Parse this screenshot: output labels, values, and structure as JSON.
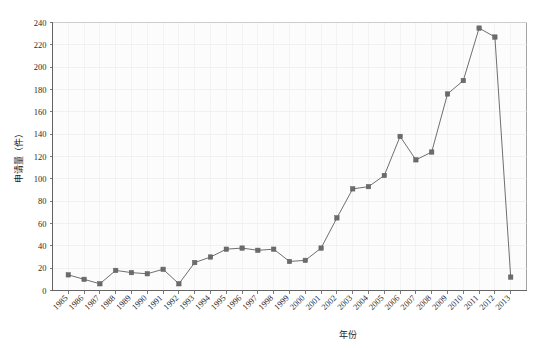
{
  "chart_data": {
    "type": "line",
    "title": "",
    "xlabel": "年份",
    "ylabel": "申请量（件）",
    "ylim": [
      0,
      240
    ],
    "ytick_step": 20,
    "grid": true,
    "legend": "none",
    "marker": "square",
    "series_color": "#6b6b6b",
    "line_color": "#6f6f6f",
    "categories": [
      "1985",
      "1986",
      "1987",
      "1988",
      "1989",
      "1990",
      "1991",
      "1992",
      "1993",
      "1994",
      "1995",
      "1996",
      "1997",
      "1998",
      "1999",
      "2000",
      "2001",
      "2002",
      "2003",
      "2004",
      "2005",
      "2006",
      "2007",
      "2008",
      "2009",
      "2010",
      "2011",
      "2012",
      "2013"
    ],
    "values": [
      14,
      10,
      6,
      18,
      16,
      15,
      19,
      6,
      25,
      30,
      37,
      38,
      36,
      37,
      26,
      27,
      38,
      65,
      91,
      93,
      103,
      138,
      117,
      124,
      176,
      188,
      235,
      227,
      12
    ],
    "ytick_labels": [
      "0",
      "20",
      "40",
      "60",
      "80",
      "100",
      "120",
      "140",
      "160",
      "180",
      "200",
      "220",
      "240"
    ],
    "ytick_values": [
      0,
      20,
      40,
      60,
      80,
      100,
      120,
      140,
      160,
      180,
      200,
      220,
      240
    ]
  }
}
